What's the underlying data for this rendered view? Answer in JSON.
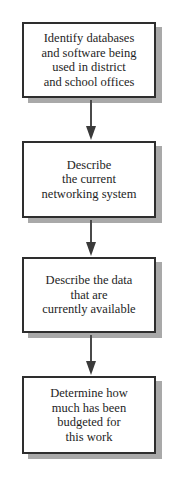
{
  "diagram": {
    "type": "flowchart",
    "direction": "top-to-bottom",
    "steps": [
      {
        "id": 1,
        "label": "Identify databases\nand software being\nused in district\nand school offices"
      },
      {
        "id": 2,
        "label": "Describe\nthe current\nnetworking system"
      },
      {
        "id": 3,
        "label": "Describe the data\nthat are\ncurrently available"
      },
      {
        "id": 4,
        "label": "Determine how\nmuch has been\nbudgeted for\nthis work"
      }
    ],
    "edges": [
      {
        "from": 1,
        "to": 2
      },
      {
        "from": 2,
        "to": 3
      },
      {
        "from": 3,
        "to": 4
      }
    ],
    "colors": {
      "border": "#2e2e2e",
      "shadow": "#a9a9a9",
      "arrow": "#3a3a3a",
      "text": "#1e1e1e",
      "background": "#ffffff"
    }
  }
}
